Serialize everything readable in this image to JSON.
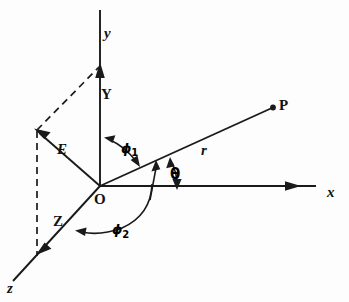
{
  "figure": {
    "background_color": "#fdfdfd",
    "ink_color": "#1a1a1a",
    "width": 349,
    "height": 302,
    "axes": [
      {
        "name": "y-axis",
        "label": "y",
        "label_style": "italic-lowercase",
        "label_x": 104,
        "label_y": 36,
        "from_x": 100,
        "from_y": 186,
        "to_x": 100,
        "to_y": 10,
        "arrow_at": "mid",
        "arrow_x": 100,
        "arrow_y": 66
      },
      {
        "name": "x-axis",
        "label": "x",
        "label_style": "italic-lowercase",
        "label_x": 327,
        "label_y": 196,
        "from_x": 100,
        "from_y": 186,
        "to_x": 315,
        "to_y": 186,
        "arrow_at": "mid",
        "arrow_x": 297,
        "arrow_y": 186
      },
      {
        "name": "z-axis",
        "label": "z",
        "label_style": "italic-lowercase",
        "label_x": 8,
        "label_y": 292,
        "from_x": 100,
        "from_y": 186,
        "to_x": 14,
        "to_y": 280,
        "arrow_at": "mid",
        "arrow_x": 41,
        "arrow_y": 250
      }
    ],
    "vectors": [
      {
        "name": "r-vector",
        "label": "r",
        "label_x": 202,
        "label_y": 153,
        "from_x": 100,
        "from_y": 186,
        "to_x": 274,
        "to_y": 107,
        "terminal": "dot"
      },
      {
        "name": "E-vector",
        "label": "E",
        "label_x": 59,
        "label_y": 152,
        "from_x": 100,
        "from_y": 186,
        "to_x": 37,
        "to_y": 131,
        "terminal": "arrow"
      }
    ],
    "points": [
      {
        "name": "origin",
        "label": "O",
        "label_x": 96,
        "label_y": 202,
        "x": 100,
        "y": 186
      },
      {
        "name": "point-p",
        "label": "P",
        "label_x": 279,
        "label_y": 107,
        "x": 274,
        "y": 107
      }
    ],
    "component_labels": [
      {
        "name": "y-component",
        "label": "Y",
        "x": 103,
        "y": 96
      },
      {
        "name": "z-component",
        "label": "Z",
        "x": 56,
        "y": 223
      }
    ],
    "angles": [
      {
        "name": "phi-1",
        "label": "ϕ",
        "subscript": "1",
        "label_x": 122,
        "label_y": 152,
        "description": "angle between y-axis and r vector, double-headed arc"
      },
      {
        "name": "theta",
        "label": "θ",
        "subscript": "",
        "label_x": 172,
        "label_y": 178,
        "description": "angle between r vector and x-axis, double-headed arc"
      },
      {
        "name": "phi-2",
        "label": "ϕ",
        "subscript": "2",
        "label_x": 115,
        "label_y": 235,
        "description": "angle between z-axis and r vector projection, arc with arrow at z end"
      }
    ],
    "dashed_construction_lines": [
      {
        "name": "dashed-e-to-y-tip",
        "from_x": 37,
        "from_y": 130,
        "to_x": 99,
        "to_y": 67
      },
      {
        "name": "dashed-vertical-projection",
        "from_x": 37,
        "from_y": 131,
        "to_x": 37,
        "to_y": 256
      }
    ]
  }
}
